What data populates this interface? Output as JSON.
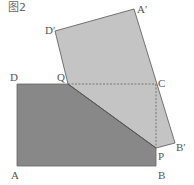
{
  "figure": {
    "title": "图2",
    "colors": {
      "rectangle_fill": "#888888",
      "folded_fill": "#c4c4c4",
      "edge": "#555555",
      "dashed": "#777777",
      "label": "#555555"
    },
    "points": {
      "A": {
        "label": "A",
        "x": 17,
        "y": 166
      },
      "B": {
        "label": "B",
        "x": 156,
        "y": 166
      },
      "C": {
        "label": "C",
        "x": 156,
        "y": 84
      },
      "D": {
        "label": "D",
        "x": 17,
        "y": 84
      },
      "Q": {
        "label": "Q",
        "x": 68,
        "y": 84
      },
      "P": {
        "label": "P",
        "x": 156,
        "y": 148
      },
      "A_prime": {
        "label": "A′",
        "x": 134,
        "y": 9
      },
      "B_prime": {
        "label": "B′",
        "x": 175,
        "y": 143
      },
      "D_prime": {
        "label": "D′",
        "x": 55,
        "y": 31
      }
    }
  }
}
